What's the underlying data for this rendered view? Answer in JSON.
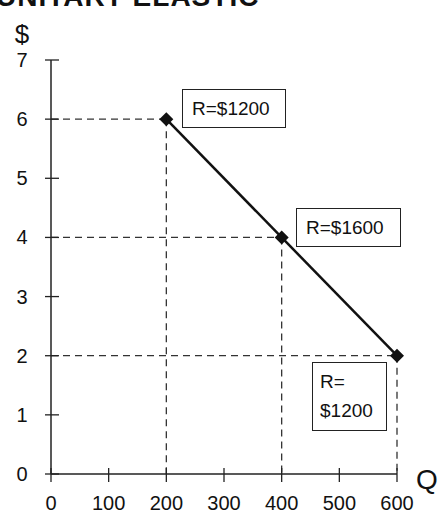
{
  "title": "UNITARY ELASTIC",
  "chart_data": {
    "type": "line",
    "xlabel": "Q",
    "ylabel": "$",
    "xlim": [
      0,
      600
    ],
    "ylim": [
      0,
      7
    ],
    "x_ticks": [
      "0",
      "100",
      "200",
      "300",
      "400",
      "500",
      "600"
    ],
    "y_ticks": [
      "0",
      "1",
      "2",
      "3",
      "4",
      "5",
      "6",
      "7"
    ],
    "grid": false,
    "series": [
      {
        "name": "Demand",
        "x": [
          200,
          400,
          600
        ],
        "y": [
          6,
          4,
          2
        ],
        "marker": "diamond"
      }
    ],
    "annotations": [
      {
        "text": "R=$1200",
        "x": 200,
        "y": 6
      },
      {
        "text": "R=$1600",
        "x": 400,
        "y": 4
      },
      {
        "text_lines": [
          "R=",
          "$1200"
        ],
        "x": 600,
        "y": 2
      }
    ],
    "guide_lines": "dashed projections from each point to both axes"
  },
  "labels": {
    "y_axis": "$",
    "x_axis": "Q",
    "box1": "R=$1200",
    "box2": "R=$1600",
    "box3_line1": "R=",
    "box3_line2": "$1200"
  }
}
